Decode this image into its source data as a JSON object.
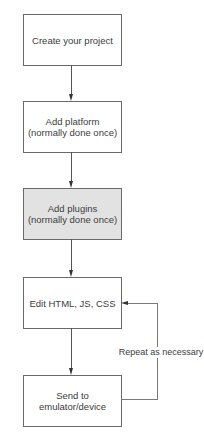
{
  "diagram": {
    "type": "flowchart",
    "steps": [
      {
        "id": "create-project",
        "label": "Create your project",
        "shaded": false
      },
      {
        "id": "add-platform",
        "label_line1": "Add platform",
        "label_line2": "(normally done once)",
        "shaded": false
      },
      {
        "id": "add-plugins",
        "label_line1": "Add plugins",
        "label_line2": "(normally done once)",
        "shaded": true
      },
      {
        "id": "edit-code",
        "label": "Edit HTML, JS, CSS",
        "shaded": false
      },
      {
        "id": "send-to-device",
        "label_line1": "Send to",
        "label_line2": "emulator/device",
        "shaded": false
      }
    ],
    "loop": {
      "from": "send-to-device",
      "to": "edit-code",
      "label": "Repeat as necessary"
    },
    "colors": {
      "border": "#6a6a6a",
      "shaded_fill": "#e2e2e2",
      "text": "#3c3c3c"
    }
  }
}
